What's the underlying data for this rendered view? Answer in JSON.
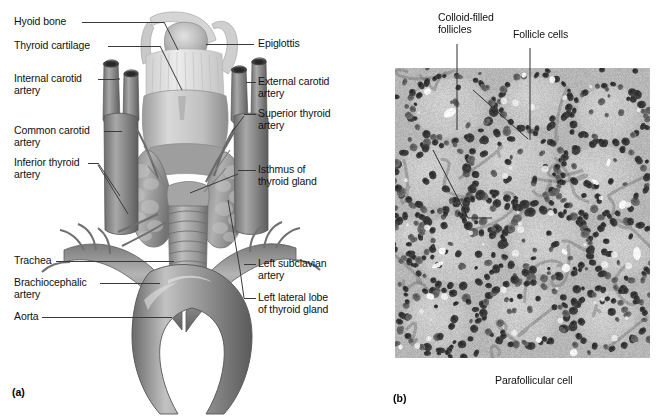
{
  "figure": {
    "panels": [
      {
        "letter": "(a)",
        "caption": "Anterior view of the thyroid gland and associated vessels"
      },
      {
        "letter": "(b)",
        "caption": "Light micrograph of thyroid follicles"
      }
    ]
  },
  "panel_a": {
    "letter": "(a)",
    "labels_left": [
      {
        "text": "Hyoid bone"
      },
      {
        "text": "Thyroid cartilage"
      },
      {
        "text": "Internal carotid\nartery"
      },
      {
        "text": "Common carotid\nartery"
      },
      {
        "text": "Inferior thyroid\nartery"
      },
      {
        "text": "Trachea"
      },
      {
        "text": "Brachiocephalic\nartery"
      },
      {
        "text": "Aorta"
      }
    ],
    "labels_right": [
      {
        "text": "Epiglottis"
      },
      {
        "text": "External carotid\nartery"
      },
      {
        "text": "Superior thyroid\nartery"
      },
      {
        "text": "Isthmus of\nthyroid gland"
      },
      {
        "text": "Left subclavian\nartery"
      },
      {
        "text": "Left lateral lobe\nof thyroid gland"
      }
    ]
  },
  "panel_b": {
    "letter": "(b)",
    "labels_top": [
      {
        "text": "Colloid-filled\nfollicles"
      },
      {
        "text": "Follicle cells"
      }
    ],
    "labels_bottom": [
      {
        "text": "Parafollicular cell"
      }
    ]
  },
  "colors": {
    "background": "#ffffff",
    "text": "#111111",
    "leader_line": "#3a3a3a",
    "micrograph_base": "#b9b9b9",
    "micrograph_nuclei": "#3c3c3c",
    "illustration_mid": "#8f8f8f",
    "illustration_dark": "#5c5c5c",
    "illustration_light": "#d8d8d8"
  }
}
